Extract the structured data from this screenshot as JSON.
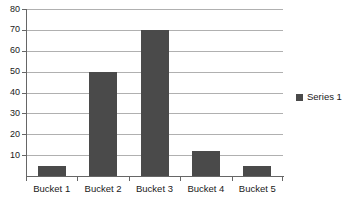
{
  "chart_data": {
    "type": "bar",
    "title": "",
    "subtitle": "",
    "xlabel": "",
    "ylabel": "",
    "categories": [
      "Bucket 1",
      "Bucket 2",
      "Bucket 3",
      "Bucket 4",
      "Bucket 5"
    ],
    "values": [
      5,
      50,
      70,
      12,
      5
    ],
    "series": [
      {
        "name": "Series 1",
        "values": [
          5,
          50,
          70,
          12,
          5
        ],
        "color": "#4a4a4a"
      }
    ],
    "ylim": [
      0,
      80
    ],
    "ytick_step": 10,
    "ytick_labels": [
      "10",
      "20",
      "30",
      "40",
      "50",
      "60",
      "70",
      "80"
    ],
    "ytick_values": [
      10,
      20,
      30,
      40,
      50,
      60,
      70,
      80
    ],
    "grid": "horizontal",
    "legend": {
      "position": "right",
      "entries": [
        {
          "label": "Series 1",
          "color": "#4a4a4a",
          "marker": "square-swatch"
        }
      ]
    },
    "colors": {
      "bar": "#4a4a4a",
      "gridline": "#b0b0b0",
      "axis": "#666666",
      "text": "#1a1a1a",
      "background": "#ffffff"
    }
  }
}
